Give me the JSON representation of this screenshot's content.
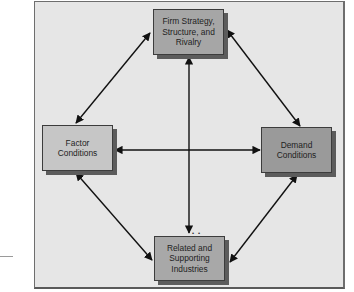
{
  "diagram": {
    "type": "Porter's Diamond",
    "nodes": {
      "top": {
        "label": "Firm Strategy,\nStructure, and\nRivalry"
      },
      "left": {
        "label": "Factor\nConditions"
      },
      "right": {
        "label": "Demand\nConditions"
      },
      "bottom": {
        "label": "Related and\nSupporting\nIndustries"
      }
    },
    "edges": [
      {
        "from": "top",
        "to": "left",
        "bidirectional": true
      },
      {
        "from": "top",
        "to": "right",
        "bidirectional": true
      },
      {
        "from": "left",
        "to": "bottom",
        "bidirectional": true
      },
      {
        "from": "right",
        "to": "bottom",
        "bidirectional": true
      },
      {
        "from": "left",
        "to": "right",
        "bidirectional": true
      },
      {
        "from": "top",
        "to": "bottom",
        "bidirectional": true
      }
    ],
    "colors": {
      "frame_background": "#e6e6e6",
      "top_box": "#a6a6a6",
      "left_box": "#c6c6c6",
      "right_box": "#9a9a9a",
      "bottom_box": "#a8a8a8",
      "shadow": "#5c5c5c",
      "arrow": "#111111"
    }
  }
}
